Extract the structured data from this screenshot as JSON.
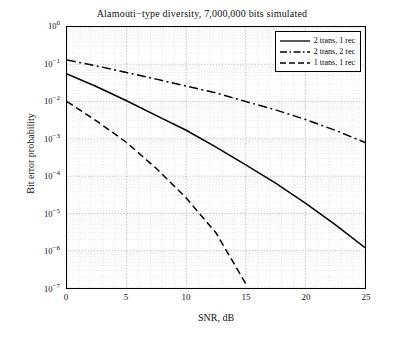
{
  "chart_data": {
    "type": "line",
    "title": "Alamouti−type diversity, 7,000,000 bits simulated",
    "xlabel": "SNR, dB",
    "ylabel": "Bit error probability",
    "xlim": [
      0,
      25
    ],
    "ylim": [
      1e-07,
      1
    ],
    "yscale": "log",
    "grid": true,
    "legend_position": "top-right",
    "xticks": [
      "0",
      "5",
      "10",
      "15",
      "20",
      "25"
    ],
    "yticks": [
      "10^0",
      "10^-1",
      "10^-2",
      "10^-3",
      "10^-4",
      "10^-5",
      "10^-6",
      "10^-7"
    ],
    "ytick_labels": [
      "10",
      "10",
      "10",
      "10",
      "10",
      "10",
      "10",
      "10"
    ],
    "ytick_exponents": [
      "0",
      "-1",
      "-2",
      "-3",
      "-4",
      "-5",
      "-6",
      "-7"
    ],
    "series": [
      {
        "name": "2 trans, 1 rec",
        "style": "solid",
        "color": "#000000",
        "x": [
          0,
          2.5,
          5,
          7.5,
          10,
          12.5,
          15,
          17.5,
          20,
          22.5,
          25
        ],
        "y": [
          0.055,
          0.025,
          0.0105,
          0.0042,
          0.0017,
          0.0006,
          0.0002,
          6.5e-05,
          1.9e-05,
          5e-06,
          1.2e-06
        ]
      },
      {
        "name": "2 trans, 2 rec",
        "style": "dashdot",
        "color": "#000000",
        "x": [
          0,
          2.5,
          5,
          7.5,
          10,
          12.5,
          15,
          17.5,
          20,
          22.5,
          25
        ],
        "y": [
          0.13,
          0.09,
          0.06,
          0.04,
          0.026,
          0.017,
          0.01,
          0.006,
          0.0033,
          0.0017,
          0.0008
        ]
      },
      {
        "name": "1 trans, 1 rec",
        "style": "dashed",
        "color": "#000000",
        "x": [
          0,
          2.5,
          5,
          7.5,
          10,
          12.5,
          15
        ],
        "y": [
          0.01,
          0.003,
          0.0008,
          0.00016,
          2.6e-05,
          3e-06,
          1.3e-07
        ]
      }
    ]
  },
  "legend": {
    "items": [
      {
        "label": "2 trans, 1 rec"
      },
      {
        "label": "2 trans, 2 rec"
      },
      {
        "label": "1 trans, 1 rec"
      }
    ]
  }
}
